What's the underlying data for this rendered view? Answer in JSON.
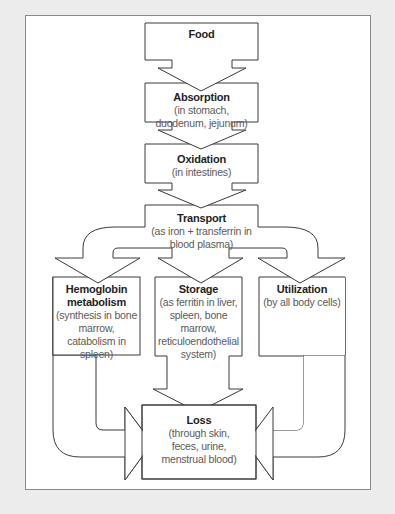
{
  "diagram": {
    "type": "flowchart",
    "topic": "Iron metabolism pathway",
    "colors": {
      "background": "#ececec",
      "panel": "#ffffff",
      "stroke": "#3a3a3a",
      "title_text": "#1e1e1e",
      "desc_text": "#5a5a5a"
    },
    "nodes": [
      {
        "id": "food",
        "title": "Food",
        "desc": ""
      },
      {
        "id": "absorption",
        "title": "Absorption",
        "desc": "(in stomach, duodenum, jejunum)"
      },
      {
        "id": "oxidation",
        "title": "Oxidation",
        "desc": "(in intestines)"
      },
      {
        "id": "transport",
        "title": "Transport",
        "desc": "(as iron + transferrin in blood plasma)"
      },
      {
        "id": "hemoglobin",
        "title": "Hemoglobin metabolism",
        "desc": "(synthesis in bone marrow, catabolism in spleen)"
      },
      {
        "id": "storage",
        "title": "Storage",
        "desc": "(as ferritin in liver, spleen, bone marrow, reticuloendothelial system)"
      },
      {
        "id": "utilization",
        "title": "Utilization",
        "desc": "(by all body cells)"
      },
      {
        "id": "loss",
        "title": "Loss",
        "desc": "(through skin, feces, urine, menstrual blood)"
      }
    ],
    "edges": [
      {
        "from": "food",
        "to": "absorption"
      },
      {
        "from": "absorption",
        "to": "oxidation"
      },
      {
        "from": "oxidation",
        "to": "transport"
      },
      {
        "from": "transport",
        "to": "hemoglobin"
      },
      {
        "from": "transport",
        "to": "storage"
      },
      {
        "from": "transport",
        "to": "utilization"
      },
      {
        "from": "hemoglobin",
        "to": "loss"
      },
      {
        "from": "storage",
        "to": "loss"
      },
      {
        "from": "utilization",
        "to": "loss"
      }
    ]
  }
}
